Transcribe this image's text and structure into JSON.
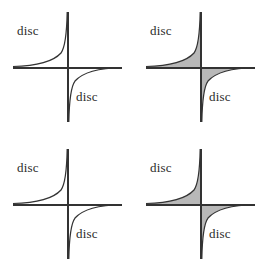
{
  "figure": {
    "title": "",
    "type": "diagram",
    "background_color": "#ffffff",
    "line_color": "#333333",
    "text_color": "#2b2b2b",
    "panel_count": 4,
    "panel_grid": "2x2"
  },
  "labels": {
    "disc": "disc"
  },
  "panels": [
    {
      "id": "panel-0",
      "position": "top-left",
      "hatched": false,
      "labels": [
        {
          "text": "disc",
          "region": "upper-left"
        },
        {
          "text": "disc",
          "region": "lower-right"
        }
      ]
    },
    {
      "id": "panel-1",
      "position": "top-right",
      "hatched": true,
      "labels": [
        {
          "text": "disc",
          "region": "upper-left"
        },
        {
          "text": "disc",
          "region": "lower-right"
        }
      ]
    },
    {
      "id": "panel-2",
      "position": "bottom-left",
      "hatched": false,
      "labels": [
        {
          "text": "disc",
          "region": "upper-left"
        },
        {
          "text": "disc",
          "region": "lower-right"
        }
      ]
    },
    {
      "id": "panel-3",
      "position": "bottom-right",
      "hatched": true,
      "labels": [
        {
          "text": "disc",
          "region": "upper-left"
        },
        {
          "text": "disc",
          "region": "lower-right"
        }
      ]
    }
  ],
  "chart_data": {
    "type": "line",
    "title": "",
    "xlabel": "",
    "ylabel": "",
    "axes": {
      "horizontal_axis": true,
      "vertical_axis": true,
      "origin": [
        68,
        68
      ],
      "x_extent": [
        13,
        122
      ],
      "y_extent": [
        12,
        122
      ],
      "grid": false,
      "ticks": []
    },
    "series": [
      {
        "name": "upper-left-branch",
        "quadrant": "II",
        "asymptotes": [
          "horizontal-axis",
          "vertical-axis"
        ],
        "x": [
          13,
          22,
          31,
          40,
          48,
          55,
          60,
          64,
          66,
          67
        ],
        "y": [
          66,
          65,
          64,
          62,
          58,
          50,
          40,
          26,
          18,
          12
        ]
      },
      {
        "name": "lower-right-branch",
        "quadrant": "IV",
        "asymptotes": [
          "horizontal-axis",
          "vertical-axis"
        ],
        "x": [
          69,
          70,
          72,
          76,
          81,
          88,
          96,
          105,
          114,
          122
        ],
        "y": [
          122,
          112,
          100,
          88,
          80,
          75,
          72,
          70,
          69,
          69
        ]
      }
    ],
    "hatching": {
      "present_in_panels": [
        "panel-1",
        "panel-3"
      ],
      "style": "vertical-lines",
      "spacing_px": 2,
      "regions": [
        "between upper-left curve branch and horizontal axis",
        "between lower-right curve branch and horizontal axis"
      ]
    },
    "legend": {
      "entries": [],
      "position": "none"
    },
    "annotations": [
      {
        "text": "disc",
        "region": "upper-left",
        "panels": [
          "panel-0",
          "panel-1",
          "panel-2",
          "panel-3"
        ]
      },
      {
        "text": "disc",
        "region": "lower-right",
        "panels": [
          "panel-0",
          "panel-1",
          "panel-2",
          "panel-3"
        ]
      }
    ]
  }
}
